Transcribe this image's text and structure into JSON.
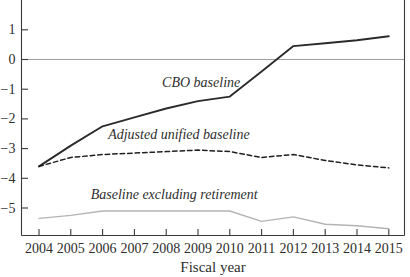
{
  "figure": {
    "background": "#ffffff",
    "axis_color": "#3a3a3a",
    "text_color": "#2e2e2e",
    "zero_line_color": "#9e9e9e"
  },
  "chart_data": {
    "type": "line",
    "x": [
      2004,
      2005,
      2006,
      2007,
      2008,
      2009,
      2010,
      2011,
      2012,
      2013,
      2014,
      2015
    ],
    "series": [
      {
        "name": "CBO baseline",
        "style": "solid",
        "color": "#2b2b2b",
        "width": 1.9,
        "values": [
          -3.6,
          -2.9,
          -2.25,
          -1.95,
          -1.65,
          -1.4,
          -1.25,
          -0.4,
          0.45,
          0.55,
          0.65,
          0.78
        ]
      },
      {
        "name": "Adjusted unified baseline",
        "style": "dashed",
        "color": "#1f1f1f",
        "width": 1.5,
        "values": [
          -3.6,
          -3.3,
          -3.2,
          -3.15,
          -3.1,
          -3.05,
          -3.1,
          -3.3,
          -3.2,
          -3.4,
          -3.55,
          -3.65
        ]
      },
      {
        "name": "Baseline excluding retirement",
        "style": "solid",
        "color": "#b4b4b4",
        "width": 1.4,
        "values": [
          -5.35,
          -5.25,
          -5.1,
          -5.1,
          -5.1,
          -5.1,
          -5.1,
          -5.45,
          -5.3,
          -5.55,
          -5.6,
          -5.7
        ]
      }
    ],
    "annotations": [
      {
        "text": "CBO baseline",
        "x": 2009.1,
        "y": -0.93
      },
      {
        "text": "Adjusted unified baseline",
        "x": 2008.4,
        "y": -2.68
      },
      {
        "text": "Baseline excluding retirement",
        "x": 2008.25,
        "y": -4.7
      }
    ],
    "xlabel": "Fiscal year",
    "ylabel": "",
    "title": "",
    "yticks": {
      "values": [
        1,
        0,
        -1,
        -2,
        -3,
        -4,
        -5
      ],
      "labels": [
        "1",
        "0",
        "−1",
        "−2",
        "−3",
        "−4",
        "−5"
      ]
    },
    "xtick_labels": [
      "2004",
      "2005",
      "2006",
      "2007",
      "2008",
      "2009",
      "2010",
      "2011",
      "2012",
      "2013",
      "2014",
      "2015"
    ],
    "ylim": [
      -5.91,
      2.0
    ],
    "zero_line": true,
    "grid": false,
    "legend_position": "inline-annotations"
  }
}
